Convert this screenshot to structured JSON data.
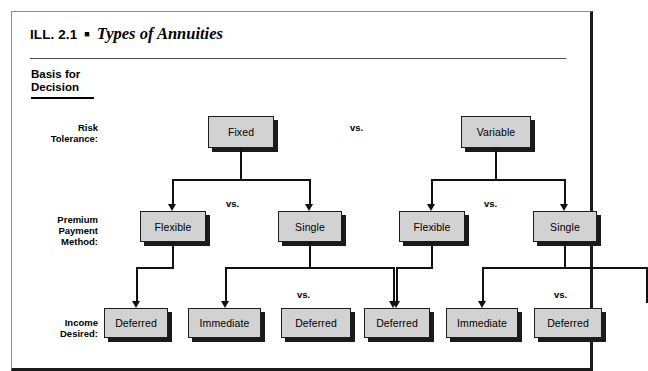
{
  "illustration": {
    "number_label": "ILL. 2.1",
    "bullet": "■",
    "title": "Types of Annuities",
    "basis_heading": "Basis for\nDecision"
  },
  "row_labels": {
    "risk": "Risk\nTolerance:",
    "premium": "Premium\nPayment\nMethod:",
    "income": "Income\nDesired:"
  },
  "separators": {
    "top": "vs.",
    "left_premium": "vs.",
    "right_premium": "vs.",
    "left_income": "vs.",
    "right_income": "vs."
  },
  "tree": {
    "level1": [
      {
        "id": "fixed",
        "label": "Fixed"
      },
      {
        "id": "variable",
        "label": "Variable"
      }
    ],
    "level2": [
      {
        "id": "fixed-flexible",
        "label": "Flexible"
      },
      {
        "id": "fixed-single",
        "label": "Single"
      },
      {
        "id": "variable-flexible",
        "label": "Flexible"
      },
      {
        "id": "variable-single",
        "label": "Single"
      }
    ],
    "level3": [
      {
        "id": "fixed-flexible-deferred",
        "label": "Deferred"
      },
      {
        "id": "fixed-single-immediate",
        "label": "Immediate"
      },
      {
        "id": "fixed-single-deferred",
        "label": "Deferred"
      },
      {
        "id": "variable-flexible-deferred",
        "label": "Deferred"
      },
      {
        "id": "variable-single-immediate",
        "label": "Immediate"
      },
      {
        "id": "variable-single-deferred",
        "label": "Deferred"
      }
    ]
  },
  "colors": {
    "node_fill": "#d2d2d2",
    "node_border": "#1d1d1d",
    "node_shadow": "#1a1a1a",
    "connector": "#111111",
    "frame_border": "#8b8b8b",
    "frame_heavy_border": "#1a1a1a",
    "background": "#ffffff"
  }
}
